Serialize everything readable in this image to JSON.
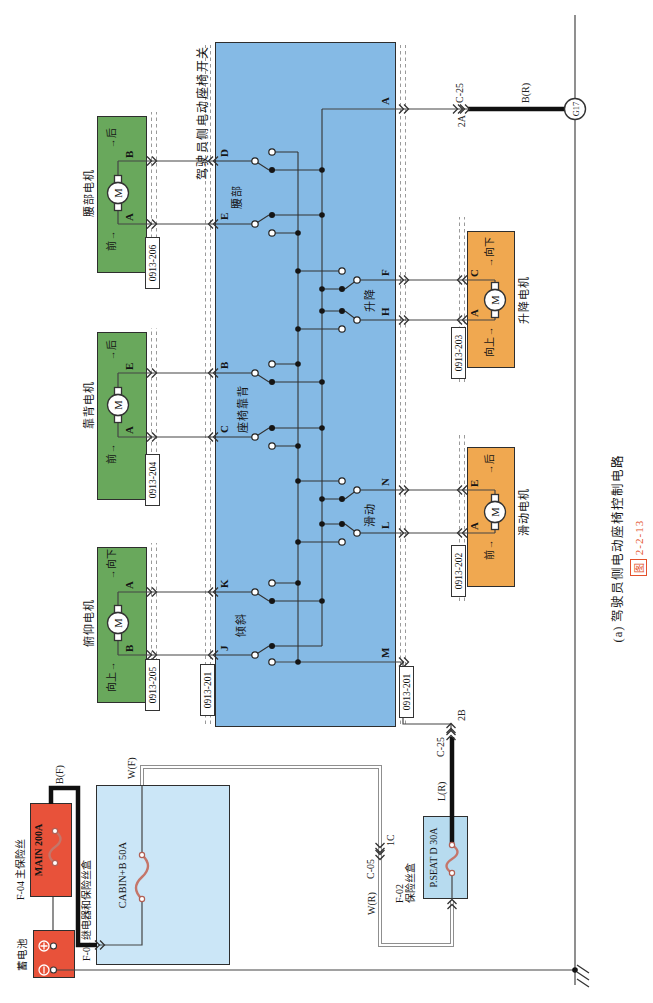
{
  "figure": {
    "caption": "(a) 驾驶员侧电动座椅控制电路",
    "fig_label": "图",
    "fig_number": "2-2-13"
  },
  "power": {
    "battery": {
      "label": "蓄电池"
    },
    "main_fuse": {
      "label": "F-04 主保险丝",
      "name": "MAIN 200A"
    },
    "relay_box": {
      "label": "F-01 继电器和保险丝盒",
      "fuse": "CABIN+B 50A"
    },
    "seat_fuse_box": {
      "label_line1": "F-02",
      "label_line2": "保险丝盒",
      "fuse": "P.SEAT D 30A"
    },
    "ground": {
      "g17": "G17"
    }
  },
  "wire_labels": {
    "bf": "B(F)",
    "wf": "W(F)",
    "wr": "W(R)",
    "lr": "L(R)",
    "br": "B(R)"
  },
  "connectors": {
    "c05": {
      "name": "C-05",
      "pin": "1C"
    },
    "c25_seat": {
      "name": "C-25",
      "pin": "2B"
    },
    "c25_ground": {
      "name": "C-25",
      "pin": "2A"
    },
    "switch_connector": "0913-201"
  },
  "seat_switch": {
    "title": "驾驶员侧电动座椅开关",
    "groups": [
      {
        "name": "腰部"
      },
      {
        "name": "座椅靠背"
      },
      {
        "name": "倾斜"
      },
      {
        "name": "升降"
      },
      {
        "name": "滑动"
      }
    ],
    "terminals_top": [
      "D",
      "E",
      "B",
      "C",
      "K",
      "J"
    ],
    "terminals_bottom": [
      "A",
      "F",
      "H",
      "N",
      "L",
      "M"
    ]
  },
  "motors": [
    {
      "name": "腰部电机",
      "connector": "0913-206",
      "terminals": [
        {
          "pin": "A",
          "dir": "前"
        },
        {
          "pin": "B",
          "dir": "后"
        }
      ]
    },
    {
      "name": "靠背电机",
      "connector": "0913-204",
      "terminals": [
        {
          "pin": "A",
          "dir": "前"
        },
        {
          "pin": "E",
          "dir": "后"
        }
      ]
    },
    {
      "name": "俯仰电机",
      "connector": "0913-205",
      "terminals": [
        {
          "pin": "B",
          "dir": "向上"
        },
        {
          "pin": "A",
          "dir": "向下"
        }
      ]
    },
    {
      "name": "升降电机",
      "connector": "0913-203",
      "terminals": [
        {
          "pin": "A",
          "dir": "向上"
        },
        {
          "pin": "C",
          "dir": "向下"
        }
      ]
    },
    {
      "name": "滑动电机",
      "connector": "0913-202",
      "terminals": [
        {
          "pin": "A",
          "dir": "前"
        },
        {
          "pin": "E",
          "dir": "后"
        }
      ]
    }
  ],
  "ui": {
    "arrow": "→",
    "motor_m": "M"
  },
  "colors": {
    "switch_blue": "#85bae5",
    "motor_green": "#69a85c",
    "motor_orange": "#f0a850",
    "box_red": "#e8523a",
    "relay_blue": "#cbe6f7",
    "fuse_box_blue": "#b7dbef",
    "caption_red": "#e4512b"
  }
}
